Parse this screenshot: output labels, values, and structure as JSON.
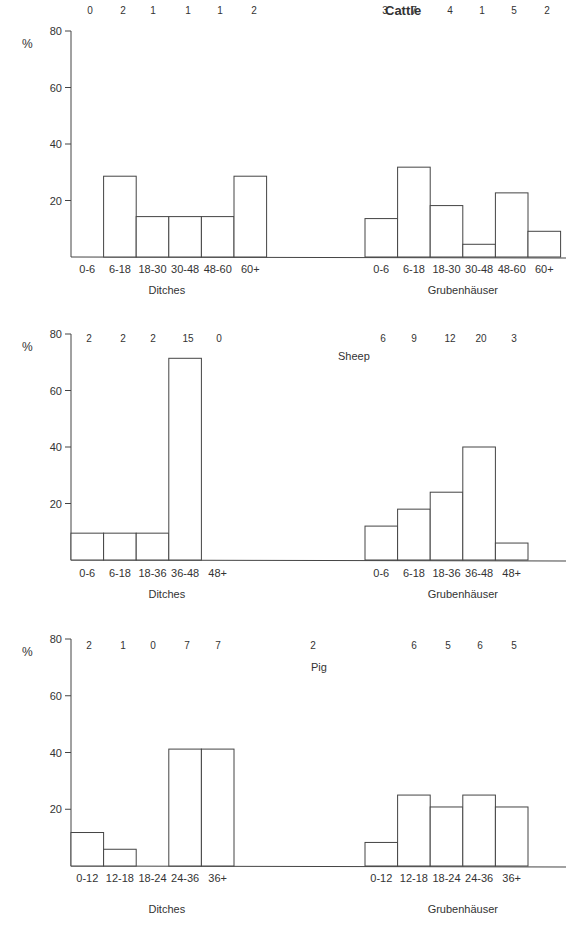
{
  "chart_data": [
    {
      "type": "bar",
      "title": "Cattle",
      "ylabel": "%",
      "ylim": [
        0,
        80
      ],
      "yticks": [
        20,
        40,
        60,
        80
      ],
      "groups": [
        {
          "name": "Ditches",
          "categories": [
            "0-6",
            "6-18",
            "18-30",
            "30-48",
            "48-60",
            "60+"
          ],
          "counts": [
            0,
            2,
            1,
            1,
            1,
            2
          ],
          "values": [
            0,
            28.6,
            14.3,
            14.3,
            14.3,
            28.6
          ]
        },
        {
          "name": "Grubenhäuser",
          "categories": [
            "0-6",
            "6-18",
            "18-30",
            "30-48",
            "48-60",
            "60+"
          ],
          "counts": [
            3,
            7,
            4,
            1,
            5,
            2
          ],
          "values": [
            13.6,
            31.8,
            18.2,
            4.5,
            22.7,
            9.1
          ]
        }
      ]
    },
    {
      "type": "bar",
      "title": "Sheep",
      "ylabel": "%",
      "ylim": [
        0,
        80
      ],
      "yticks": [
        20,
        40,
        60,
        80
      ],
      "groups": [
        {
          "name": "Ditches",
          "categories": [
            "0-6",
            "6-18",
            "18-36",
            "36-48",
            "48+"
          ],
          "counts": [
            2,
            2,
            2,
            15,
            0
          ],
          "values": [
            9.5,
            9.5,
            9.5,
            71.4,
            0
          ]
        },
        {
          "name": "Grubenhäuser",
          "categories": [
            "0-6",
            "6-18",
            "18-36",
            "36-48",
            "48+"
          ],
          "counts": [
            6,
            9,
            12,
            20,
            3
          ],
          "values": [
            12,
            18,
            24,
            40,
            6
          ]
        }
      ]
    },
    {
      "type": "bar",
      "title": "Pig",
      "ylabel": "%",
      "ylim": [
        0,
        80
      ],
      "yticks": [
        20,
        40,
        60,
        80
      ],
      "groups": [
        {
          "name": "Ditches",
          "categories": [
            "0-12",
            "12-18",
            "18-24",
            "24-36",
            "36+"
          ],
          "counts": [
            2,
            1,
            0,
            7,
            7
          ],
          "values": [
            11.8,
            5.9,
            0,
            41.2,
            41.2
          ]
        },
        {
          "name": "Grubenhäuser",
          "categories": [
            "0-12",
            "12-18",
            "18-24",
            "24-36",
            "36+"
          ],
          "counts": [
            2,
            6,
            5,
            6,
            5
          ],
          "values": [
            8.3,
            25.0,
            20.8,
            25.0,
            20.8
          ]
        }
      ]
    }
  ],
  "layout": {
    "panels": [
      {
        "y80": 31,
        "y0": 257,
        "title_x": 385,
        "title_y": 12,
        "title_bold": true,
        "counts_y": 10,
        "gl_x0": 71,
        "gr_x0": 365,
        "bar_w": 32.6,
        "cat_y": 273,
        "group_label_y": 294,
        "count_x_left": [
          90,
          123,
          153,
          188,
          220,
          254
        ],
        "count_x_right": [
          385,
          414,
          450,
          482,
          514,
          547
        ]
      },
      {
        "y80": 334,
        "y0": 560,
        "title_x": 338,
        "title_y": 357,
        "title_bold": false,
        "counts_y": 338,
        "gl_x0": 71,
        "gr_x0": 365,
        "bar_w": 32.6,
        "cat_y": 577,
        "group_label_y": 598,
        "count_x_left": [
          89,
          123,
          153,
          188,
          219
        ],
        "count_x_right": [
          383,
          414,
          450,
          481,
          514
        ]
      },
      {
        "y80": 639,
        "y0": 866,
        "title_x": 311,
        "title_y": 668,
        "title_bold": false,
        "counts_y": 645,
        "gl_x0": 71,
        "gr_x0": 365,
        "bar_w": 32.6,
        "cat_y": 882,
        "group_label_y": 913,
        "count_x_left": [
          89,
          123,
          153,
          187,
          218
        ],
        "count_x_right": [
          313,
          414,
          448,
          480,
          514
        ]
      }
    ]
  }
}
